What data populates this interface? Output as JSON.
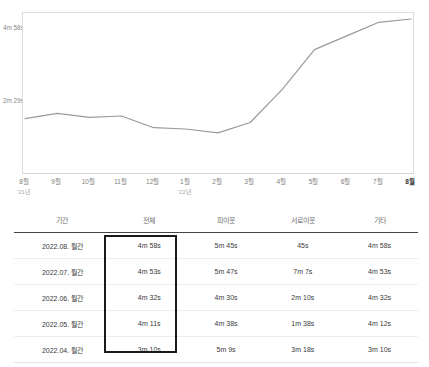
{
  "chart_data": {
    "type": "line",
    "title": "",
    "xlabel": "",
    "ylabel": "",
    "x": [
      "8월",
      "9월",
      "10월",
      "11월",
      "12월",
      "1월",
      "2월",
      "3월",
      "4월",
      "5월",
      "6월",
      "7월",
      "8월"
    ],
    "x_year_labels": [
      {
        "index": 0,
        "label": "'21년"
      },
      {
        "index": 5,
        "label": "'22년"
      }
    ],
    "series": [
      {
        "name": "전체",
        "values": [
          "2m 25s",
          "2m 33s",
          "2m 27s",
          "2m 29s",
          "2m 11s",
          "2m 9s",
          "2m 3s",
          "2m 19s",
          "3m 10s",
          "4m 11s",
          "4m 32s",
          "4m 53s",
          "4m 58s"
        ],
        "values_seconds": [
          145,
          153,
          147,
          149,
          131,
          129,
          123,
          139,
          190,
          251,
          272,
          293,
          298
        ],
        "color": "#9a9a9a"
      }
    ],
    "yticks": [
      {
        "label": "4m 58s",
        "seconds": 298
      },
      {
        "label": "2m 29s",
        "seconds": 149
      }
    ],
    "ylim_seconds": [
      0,
      305
    ],
    "grid": false,
    "legend": "none"
  },
  "table": {
    "headers": [
      "기간",
      "전체",
      "피이웃",
      "서로이웃",
      "기타"
    ],
    "rows": [
      {
        "period": "2022.08. 월간",
        "total": "4m 58s",
        "peer": "5m 45s",
        "mutual": "45s",
        "etc": "4m 58s"
      },
      {
        "period": "2022.07. 월간",
        "total": "4m 53s",
        "peer": "5m 47s",
        "mutual": "7m 7s",
        "etc": "4m 53s"
      },
      {
        "period": "2022.06. 월간",
        "total": "4m 32s",
        "peer": "4m 30s",
        "mutual": "2m 10s",
        "etc": "4m 32s"
      },
      {
        "period": "2022.05. 월간",
        "total": "4m 11s",
        "peer": "4m 38s",
        "mutual": "1m 38s",
        "etc": "4m 12s"
      },
      {
        "period": "2022.04. 월간",
        "total": "3m 10s",
        "peer": "5m 9s",
        "mutual": "3m 18s",
        "etc": "3m 10s"
      }
    ]
  },
  "colors": {
    "line": "#9a9a9a",
    "highlight_border": "#1a1a1a",
    "header_rule": "#454545",
    "row_rule": "#ededed",
    "frame": "#dcdcdc"
  }
}
